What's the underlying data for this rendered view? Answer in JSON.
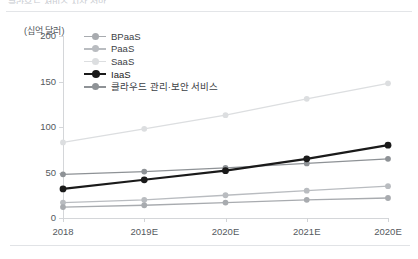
{
  "header": {
    "cropped_caption": "클라우드 서비스 시장 전망"
  },
  "chart_data": {
    "type": "line",
    "title": "",
    "unit_label": "(십억 달러)",
    "xlabel": "",
    "ylabel": "",
    "categories": [
      "2018",
      "2019E",
      "2020E",
      "2021E",
      "2020E"
    ],
    "ylim": [
      0,
      200
    ],
    "yticks": [
      0,
      50,
      100,
      150,
      200
    ],
    "grid": false,
    "legend_position": "top-left-inside",
    "series": [
      {
        "name": "BPaaS",
        "values": [
          12,
          14,
          17,
          20,
          22
        ],
        "color": "#a8abaf"
      },
      {
        "name": "PaaS",
        "values": [
          17,
          20,
          25,
          30,
          35
        ],
        "color": "#b9bcc0"
      },
      {
        "name": "SaaS",
        "values": [
          83,
          98,
          113,
          131,
          148
        ],
        "color": "#dcdee0"
      },
      {
        "name": "IaaS",
        "values": [
          32,
          42,
          52,
          65,
          80
        ],
        "color": "#1a1a1a"
      },
      {
        "name": "클라우드 관리·보안 서비스",
        "values": [
          48,
          51,
          55,
          60,
          65
        ],
        "color": "#8e9296"
      }
    ]
  }
}
